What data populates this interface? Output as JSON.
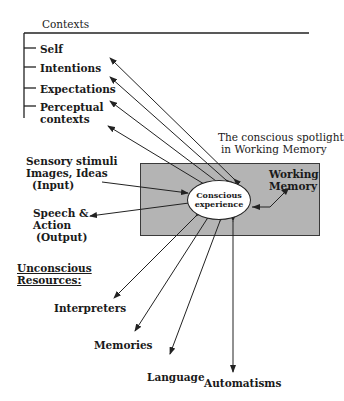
{
  "diagram": {
    "contexts": {
      "title": "Contexts",
      "items": [
        "Self",
        "Intentions",
        "Expectations",
        "Perceptual",
        "contexts"
      ]
    },
    "spotlight_caption": [
      "The conscious spotlight",
      "in Working Memory"
    ],
    "working_memory_label": [
      "Working",
      "Memory"
    ],
    "center_node": [
      "Conscious",
      "experience"
    ],
    "input": [
      "Sensory stimuli",
      "Images, Ideas",
      "(Input)"
    ],
    "output": [
      "Speech &",
      "Action",
      "(Output)"
    ],
    "unconscious_header": [
      "Unconscious",
      "Resources:"
    ],
    "resources": [
      "Interpreters",
      "Memories",
      "Language",
      "Automatisms"
    ],
    "colors": {
      "working_memory_fill": "#b4b4b4",
      "line": "#222222",
      "background": "#ffffff"
    }
  }
}
